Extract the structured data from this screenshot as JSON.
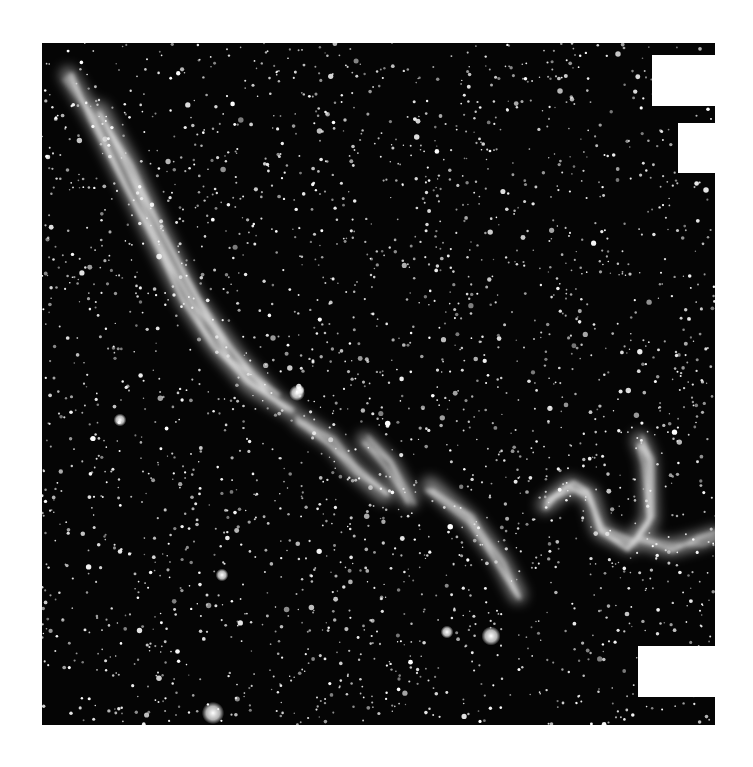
{
  "image": {
    "subject": "Veil Nebula (NGC 6960 region) star field",
    "style": "black-and-white astronomical photograph",
    "frame": {
      "x": 42,
      "y": 43,
      "width": 673,
      "height": 682
    },
    "background_color": "#050505",
    "nebula_color": "#e8e8e8",
    "star_color": "#ffffff"
  },
  "cutouts": [
    {
      "name": "cutout-top-1",
      "x": 652,
      "y": 55,
      "width": 63,
      "height": 51
    },
    {
      "name": "cutout-top-2",
      "x": 678,
      "y": 123,
      "width": 37,
      "height": 50
    },
    {
      "name": "cutout-bottom",
      "x": 638,
      "y": 646,
      "width": 77,
      "height": 51
    }
  ],
  "bright_stars": [
    {
      "x": 213,
      "y": 713,
      "r": 7
    },
    {
      "x": 491,
      "y": 636,
      "r": 6
    },
    {
      "x": 447,
      "y": 632,
      "r": 4
    },
    {
      "x": 297,
      "y": 393,
      "r": 5
    },
    {
      "x": 222,
      "y": 575,
      "r": 4
    },
    {
      "x": 120,
      "y": 420,
      "r": 4
    },
    {
      "x": 300,
      "y": 390,
      "r": 3
    }
  ],
  "nebula_filaments": [
    {
      "name": "main-arc",
      "points": "68,75 95,120 125,180 155,240 185,300 215,345 250,385 290,410"
    },
    {
      "name": "main-arc-inner",
      "points": "100,110 130,165 160,230 195,300 235,355 275,400"
    },
    {
      "name": "middle-wisp-1",
      "points": "300,420 330,440 355,470 385,495"
    },
    {
      "name": "middle-wisp-2",
      "points": "365,440 390,465 410,500"
    },
    {
      "name": "lower-streak",
      "points": "430,485 470,520 500,560 518,595"
    },
    {
      "name": "right-loop",
      "points": "545,505 570,485 590,495 600,530 630,545 650,520 648,460 640,440"
    },
    {
      "name": "right-tail",
      "points": "640,540 670,548 700,540 715,535"
    }
  ]
}
